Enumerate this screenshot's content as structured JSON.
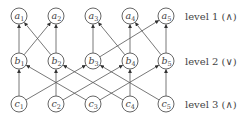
{
  "diagram": {
    "levels": [
      {
        "id": "level1",
        "label": "level 1 (∧)",
        "nodes": [
          {
            "id": "a1",
            "base": "a",
            "sub": "1"
          },
          {
            "id": "a2",
            "base": "a",
            "sub": "2"
          },
          {
            "id": "a3",
            "base": "a",
            "sub": "3"
          },
          {
            "id": "a4",
            "base": "a",
            "sub": "4"
          },
          {
            "id": "a5",
            "base": "a",
            "sub": "5"
          }
        ]
      },
      {
        "id": "level2",
        "label": "level 2 (∨)",
        "nodes": [
          {
            "id": "b1",
            "base": "b",
            "sub": "1"
          },
          {
            "id": "b2",
            "base": "b",
            "sub": "2"
          },
          {
            "id": "b3",
            "base": "b",
            "sub": "3"
          },
          {
            "id": "b4",
            "base": "b",
            "sub": "4"
          },
          {
            "id": "b5",
            "base": "b",
            "sub": "5"
          }
        ]
      },
      {
        "id": "level3",
        "label": "level 3 (∧)",
        "nodes": [
          {
            "id": "c1",
            "base": "c",
            "sub": "1"
          },
          {
            "id": "c2",
            "base": "c",
            "sub": "2"
          },
          {
            "id": "c3",
            "base": "c",
            "sub": "3"
          },
          {
            "id": "c4",
            "base": "c",
            "sub": "4"
          },
          {
            "id": "c5",
            "base": "c",
            "sub": "5"
          }
        ]
      }
    ],
    "edges": [
      {
        "from": "b1",
        "to": "a1"
      },
      {
        "from": "b1",
        "to": "a2"
      },
      {
        "from": "b2",
        "to": "a1"
      },
      {
        "from": "b2",
        "to": "a2"
      },
      {
        "from": "b3",
        "to": "a3"
      },
      {
        "from": "b3",
        "to": "a5"
      },
      {
        "from": "b4",
        "to": "a3"
      },
      {
        "from": "b4",
        "to": "a4"
      },
      {
        "from": "b5",
        "to": "a4"
      },
      {
        "from": "b5",
        "to": "a5"
      },
      {
        "from": "c1",
        "to": "b1"
      },
      {
        "from": "c1",
        "to": "b3"
      },
      {
        "from": "c2",
        "to": "b2"
      },
      {
        "from": "c2",
        "to": "b4"
      },
      {
        "from": "c3",
        "to": "b1"
      },
      {
        "from": "c3",
        "to": "b5"
      },
      {
        "from": "c4",
        "to": "b2"
      },
      {
        "from": "c4",
        "to": "b4"
      },
      {
        "from": "c5",
        "to": "b3"
      },
      {
        "from": "c5",
        "to": "b5"
      }
    ],
    "colors": {
      "stroke": "#555555",
      "text": "#444444",
      "background": "#ffffff"
    }
  }
}
